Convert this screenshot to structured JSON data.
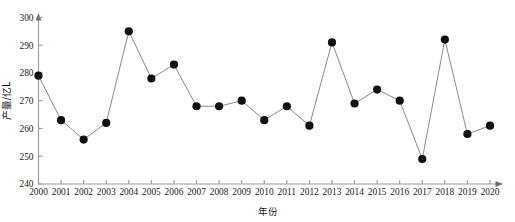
{
  "chart_data": {
    "type": "line",
    "title": "",
    "subtitle": "",
    "xlabel": "年份",
    "ylabel": "产量/亿L",
    "categories": [
      "2000",
      "2001",
      "2002",
      "2003",
      "2004",
      "2005",
      "2006",
      "2007",
      "2008",
      "2009",
      "2010",
      "2011",
      "2012",
      "2013",
      "2014",
      "2015",
      "2016",
      "2017",
      "2018",
      "2019",
      "2020"
    ],
    "values": [
      279,
      263,
      256,
      262,
      295,
      278,
      283,
      268,
      268,
      270,
      263,
      268,
      261,
      291,
      269,
      274,
      270,
      249,
      292,
      258,
      261
    ],
    "series": [
      {
        "name": "产量",
        "values": [
          279,
          263,
          256,
          262,
          295,
          278,
          283,
          268,
          268,
          270,
          263,
          268,
          261,
          291,
          269,
          274,
          270,
          249,
          292,
          258,
          261
        ]
      }
    ],
    "xlim": [
      2000,
      2020
    ],
    "ylim": [
      240,
      300
    ],
    "yticks": [
      240,
      250,
      260,
      270,
      280,
      290,
      300
    ],
    "ytick_labels": [
      "240",
      "250",
      "260",
      "270",
      "280",
      "290",
      "300"
    ],
    "xticks": [
      "2000",
      "2001",
      "2002",
      "2003",
      "2004",
      "2005",
      "2006",
      "2007",
      "2008",
      "2009",
      "2010",
      "2011",
      "2012",
      "2013",
      "2014",
      "2015",
      "2016",
      "2017",
      "2018",
      "2019",
      "2020"
    ],
    "grid": false,
    "legend": false,
    "legend_position": "none",
    "marker": "filled-circle",
    "line_color": "#8a8a8a",
    "marker_color": "#101010",
    "axis_color": "#9a9a9a",
    "x_axis_has_arrow": true,
    "y_axis_has_arrow": true
  }
}
